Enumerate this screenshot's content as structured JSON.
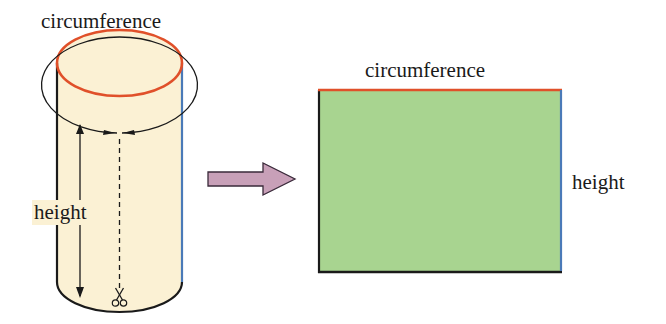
{
  "cylinder": {
    "top_label": "circumference",
    "side_label": "height",
    "fill_color": "#fbf1d4",
    "circumference_color": "#e0502a",
    "seam_color": "#4a7ab8",
    "outline_color": "#1a1a1a",
    "cut_icon": "scissors-icon"
  },
  "transform_arrow": {
    "direction": "right",
    "fill_color": "#c8a0b8"
  },
  "rectangle": {
    "top_label": "circumference",
    "side_label": "height",
    "fill_color": "#a8d490",
    "top_edge_color": "#e0502a",
    "right_edge_color": "#4a7ab8",
    "outline_color": "#1a1a1a"
  }
}
